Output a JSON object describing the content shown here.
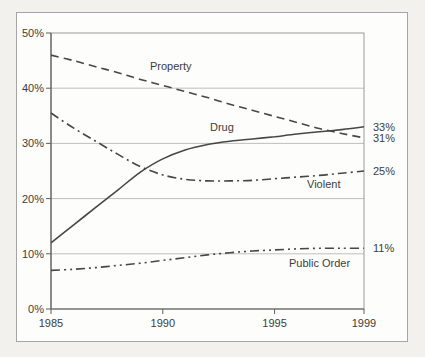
{
  "colors": {
    "outer_background": "#f2f1ee",
    "panel_background": "#fdfdfb",
    "panel_border": "#a5a5a5",
    "plot_box": "#9a9a9a",
    "axis": "#5f5f5f",
    "grid": "#bfbfbf",
    "line": "#474747",
    "text": "#3c3c3c"
  },
  "chart_data": {
    "type": "line",
    "x": [
      1985,
      1986,
      1987,
      1988,
      1989,
      1990,
      1991,
      1992,
      1993,
      1994,
      1995,
      1996,
      1997,
      1998,
      1999
    ],
    "xlim": [
      1985,
      1999
    ],
    "ylim": [
      0,
      50
    ],
    "grid": true,
    "legend_position": "inline-labels",
    "y_ticks": [
      {
        "value": 0,
        "label": "0%"
      },
      {
        "value": 10,
        "label": "10%"
      },
      {
        "value": 20,
        "label": "20%"
      },
      {
        "value": 30,
        "label": "30%"
      },
      {
        "value": 40,
        "label": "40%"
      },
      {
        "value": 50,
        "label": "50%"
      }
    ],
    "x_ticks": [
      {
        "value": 1985,
        "label": "1985"
      },
      {
        "value": 1990,
        "label": "1990"
      },
      {
        "value": 1995,
        "label": "1995"
      },
      {
        "value": 1999,
        "label": "1999"
      }
    ],
    "series": [
      {
        "name": "Property",
        "style": "dashed",
        "end_label": "31%",
        "values": [
          46,
          45,
          43.9,
          42.8,
          41.6,
          40.5,
          39.4,
          38.3,
          37.1,
          36,
          34.9,
          33.8,
          32.7,
          31.8,
          31
        ]
      },
      {
        "name": "Violent",
        "style": "dash-dot",
        "end_label": "25%",
        "values": [
          35.5,
          32.8,
          30.4,
          28,
          25.8,
          24.3,
          23.5,
          23.2,
          23.2,
          23.3,
          23.6,
          23.9,
          24.2,
          24.6,
          25
        ]
      },
      {
        "name": "Drug",
        "style": "solid",
        "end_label": "33%",
        "values": [
          12,
          15.2,
          18.4,
          21.6,
          24.8,
          27.2,
          28.8,
          29.8,
          30.4,
          30.8,
          31.2,
          31.7,
          32.1,
          32.5,
          33
        ]
      },
      {
        "name": "Public Order",
        "style": "dash-dot-dot",
        "end_label": "11%",
        "values": [
          7,
          7.2,
          7.5,
          7.9,
          8.3,
          8.8,
          9.3,
          9.8,
          10.2,
          10.5,
          10.7,
          10.9,
          11,
          11,
          11
        ]
      }
    ]
  }
}
